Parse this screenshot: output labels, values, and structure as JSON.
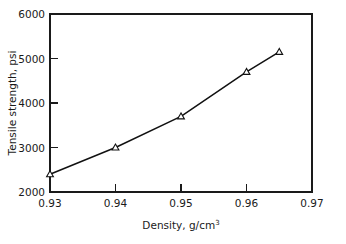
{
  "chart_data": {
    "type": "line",
    "title": "",
    "subtitle": "",
    "xlabel": "Density, g/cm",
    "xlabel_superscript": "3",
    "xlabel_full": "Density, g/cm3",
    "ylabel": "Tensile strength, psi",
    "xlim": [
      0.93,
      0.97
    ],
    "ylim": [
      2000,
      6000
    ],
    "xticks": [
      0.93,
      0.94,
      0.95,
      0.96,
      0.97
    ],
    "xtick_labels": [
      "0.93",
      "0.94",
      "0.95",
      "0.96",
      "0.97"
    ],
    "yticks": [
      2000,
      3000,
      4000,
      5000,
      6000
    ],
    "ytick_labels": [
      "2000",
      "3000",
      "4000",
      "5000",
      "6000"
    ],
    "grid": false,
    "legend": false,
    "legend_position": "none",
    "marker": "triangle-up-open",
    "line_color": "#111111",
    "marker_face_color": "#ffffff",
    "marker_edge_color": "#111111",
    "axis_color": "#1a1a1a",
    "background_color": "#ffffff",
    "tick_direction": "in",
    "series": [
      {
        "name": "Tensile strength",
        "x": [
          0.93,
          0.94,
          0.95,
          0.96,
          0.965
        ],
        "values": [
          2400,
          3000,
          3700,
          4700,
          5150
        ]
      }
    ],
    "points": [
      {
        "x": 0.93,
        "y": 2400
      },
      {
        "x": 0.94,
        "y": 3000
      },
      {
        "x": 0.95,
        "y": 3700
      },
      {
        "x": 0.96,
        "y": 4700
      },
      {
        "x": 0.965,
        "y": 5150
      }
    ],
    "annotations": []
  }
}
